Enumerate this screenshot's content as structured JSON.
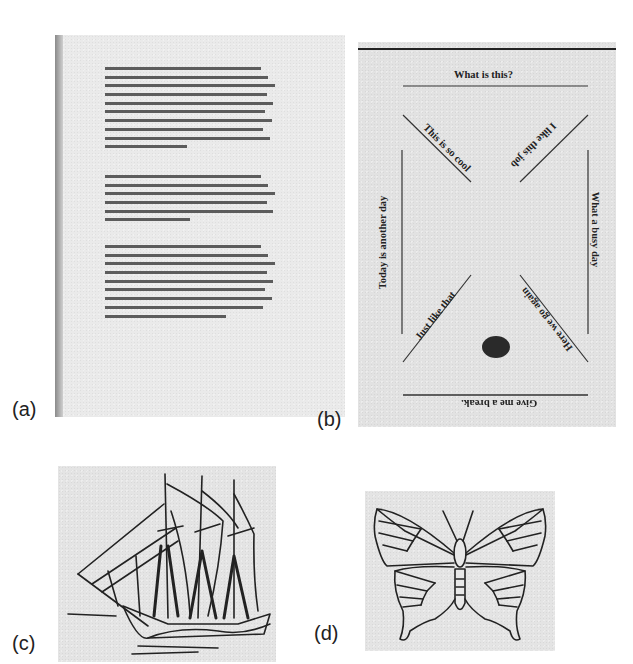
{
  "figure": {
    "panels": [
      {
        "id": "a",
        "label": "(a)",
        "description": "Scanned page of typewritten text (illegible at this resolution)",
        "paragraphs": [
          {
            "line_count": 10
          },
          {
            "line_count": 6
          },
          {
            "line_count": 9
          }
        ]
      },
      {
        "id": "b",
        "label": "(b)",
        "description": "Sketch with text labels along lines and a filled dot",
        "texts": {
          "top": "What is this?",
          "upper_left_diagonal": "This is so cool",
          "upper_right_diagonal": "I like this job",
          "left_vertical": "Today is another day",
          "right_vertical": "What a busy day",
          "lower_left_diagonal": "Just like that",
          "lower_right_diagonal": "Here we go again",
          "bottom": "Give me a break."
        }
      },
      {
        "id": "c",
        "label": "(c)",
        "description": "Line drawing of a three-masted sailing ship"
      },
      {
        "id": "d",
        "label": "(d)",
        "description": "Line drawing of a butterfly"
      }
    ],
    "colors": {
      "ink": "#222222",
      "paper": "#e4e4e4",
      "background": "#ffffff"
    }
  }
}
